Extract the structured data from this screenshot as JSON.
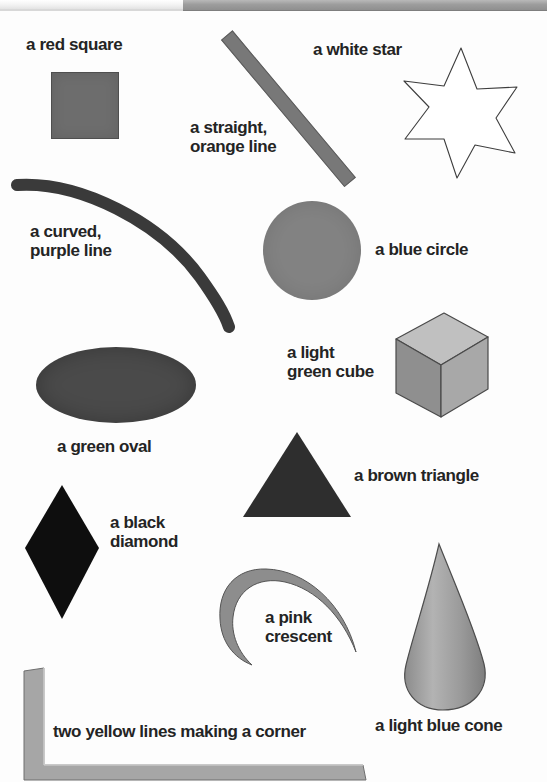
{
  "page": {
    "kind": "illustrated-shape-vocabulary-page",
    "background_color": "#fdfdfd",
    "scan_strip_color": "#9d9d9d"
  },
  "labels": [
    {
      "id": "red-square",
      "text": "a red square"
    },
    {
      "id": "white-star",
      "text": "a white star"
    },
    {
      "id": "straight-orange-line-1",
      "text": "a straight,"
    },
    {
      "id": "straight-orange-line-2",
      "text": "orange line"
    },
    {
      "id": "curved-purple-line-1",
      "text": "a curved,"
    },
    {
      "id": "curved-purple-line-2",
      "text": "purple line"
    },
    {
      "id": "blue-circle",
      "text": "a blue circle"
    },
    {
      "id": "light-green-cube-1",
      "text": "a light"
    },
    {
      "id": "light-green-cube-2",
      "text": "green cube"
    },
    {
      "id": "green-oval",
      "text": "a green oval"
    },
    {
      "id": "brown-triangle",
      "text": "a brown triangle"
    },
    {
      "id": "black-diamond-1",
      "text": "a black"
    },
    {
      "id": "black-diamond-2",
      "text": "diamond"
    },
    {
      "id": "pink-crescent-1",
      "text": "a pink"
    },
    {
      "id": "pink-crescent-2",
      "text": "crescent"
    },
    {
      "id": "yellow-corner",
      "text": "two yellow lines making a corner"
    },
    {
      "id": "light-blue-cone",
      "text": "a light blue cone"
    }
  ],
  "shapes": [
    {
      "id": "red-square",
      "name": "square",
      "named_color": "red",
      "rendered_color": "#6d6d6d"
    },
    {
      "id": "white-star",
      "name": "star",
      "named_color": "white",
      "rendered_color": "#ffffff",
      "points": 6
    },
    {
      "id": "straight-orange-line",
      "name": "straight line",
      "named_color": "orange",
      "rendered_color": "#787878"
    },
    {
      "id": "curved-purple-line",
      "name": "curved line",
      "named_color": "purple",
      "rendered_color": "#3a3a3a"
    },
    {
      "id": "blue-circle",
      "name": "circle",
      "named_color": "blue",
      "rendered_color": "#828282"
    },
    {
      "id": "light-green-cube",
      "name": "cube",
      "named_color": "light green",
      "rendered_color": "#9a9a9a"
    },
    {
      "id": "green-oval",
      "name": "oval",
      "named_color": "green",
      "rendered_color": "#4a4a4a"
    },
    {
      "id": "brown-triangle",
      "name": "triangle",
      "named_color": "brown",
      "rendered_color": "#2e2e2e"
    },
    {
      "id": "black-diamond",
      "name": "diamond",
      "named_color": "black",
      "rendered_color": "#0e0e0e"
    },
    {
      "id": "pink-crescent",
      "name": "crescent",
      "named_color": "pink",
      "rendered_color": "#8d8d8d"
    },
    {
      "id": "yellow-corner",
      "name": "two lines making a corner",
      "named_color": "yellow",
      "rendered_color": "#a6a6a6"
    },
    {
      "id": "light-blue-cone",
      "name": "cone",
      "named_color": "light blue",
      "rendered_color": "#9b9b9b"
    }
  ]
}
